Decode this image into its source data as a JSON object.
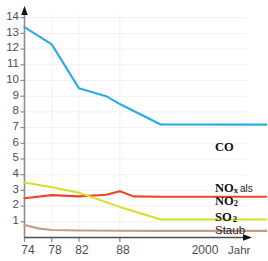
{
  "chart_data": {
    "type": "line",
    "title": "",
    "xlabel": "Jahr",
    "ylabel": "",
    "xlim": [
      74,
      2001
    ],
    "ylim": [
      0,
      14.4
    ],
    "grid": true,
    "legend_position": "right-inline",
    "x_tick_labels": [
      "74",
      "78",
      "82",
      "88",
      "2000"
    ],
    "x_tick_values": [
      74,
      78,
      82,
      88,
      2000
    ],
    "y_tick_labels": [
      "1",
      "2",
      "3",
      "4",
      "5",
      "6",
      "7",
      "8",
      "9",
      "10",
      "11",
      "12",
      "13",
      "14"
    ],
    "y_tick_values": [
      1,
      2,
      3,
      4,
      5,
      6,
      7,
      8,
      9,
      10,
      11,
      12,
      13,
      14
    ],
    "series": [
      {
        "name": "CO",
        "color": "#29abe2",
        "label_html": "CO",
        "x": [
          74,
          78,
          82,
          86,
          88,
          94,
          2001
        ],
        "values": [
          13.4,
          12.3,
          9.5,
          9.0,
          8.5,
          7.2,
          5.7
        ]
      },
      {
        "name": "NOx als NO2",
        "color": "#ef4423",
        "label_html": "NO<sub>x</sub> als NO<sub>2</sub>",
        "x": [
          74,
          78,
          82,
          86,
          88,
          90,
          94,
          2001
        ],
        "values": [
          2.5,
          2.7,
          2.62,
          2.72,
          2.95,
          2.62,
          2.6,
          2.15
        ]
      },
      {
        "name": "SO2",
        "color": "#d7df28",
        "label_html": "SO<sub>2</sub>",
        "x": [
          74,
          78,
          82,
          88,
          94,
          2001
        ],
        "values": [
          3.5,
          3.2,
          2.85,
          1.95,
          1.15,
          0.85
        ]
      },
      {
        "name": "Staub",
        "color": "#c89a85",
        "label_html": "Staub",
        "x": [
          74,
          76,
          78,
          82,
          88,
          94,
          2001
        ],
        "values": [
          0.8,
          0.58,
          0.48,
          0.45,
          0.43,
          0.42,
          0.4
        ]
      }
    ]
  },
  "axes": {
    "x_axis_title": "Jahr",
    "axis_color": "#8c8c8c",
    "grid_color": "#eef0f4",
    "tick_text_color": "#4d4d4d"
  },
  "labels": {
    "co": "CO",
    "nox_line1_main": "NO",
    "nox_line1_sub": "x",
    "nox_line1_alt": "als",
    "nox_line2_main": "NO",
    "nox_line2_sub": "2",
    "so2_main": "SO",
    "so2_sub": "2",
    "staub": "Staub",
    "jahr": "Jahr"
  }
}
